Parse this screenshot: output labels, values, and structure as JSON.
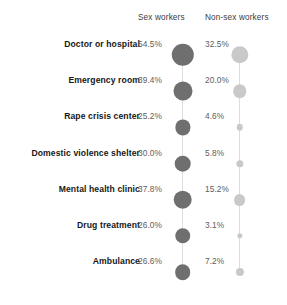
{
  "chart_data": {
    "type": "scatter",
    "title": "",
    "subtitle": "",
    "xlabel": "",
    "ylabel": "",
    "legend_position": "top",
    "grid": false,
    "encoding": "bubble area proportional to percentage",
    "categories": [
      "Doctor or hospital",
      "Emergency room",
      "Rape crisis center",
      "Domestic violence shelter",
      "Mental health clinic",
      "Drug treatment",
      "Ambulance"
    ],
    "series": [
      {
        "name": "Sex workers",
        "color": "#6f6f6f",
        "values": [
          54.5,
          39.4,
          25.2,
          30.0,
          37.8,
          26.0,
          26.6
        ],
        "labels": [
          "54.5%",
          "39.4%",
          "25.2%",
          "30.0%",
          "37.8%",
          "26.0%",
          "26.6%"
        ]
      },
      {
        "name": "Non-sex workers",
        "color": "#c9c9c9",
        "values": [
          32.5,
          20.0,
          4.6,
          5.8,
          15.2,
          3.1,
          7.2
        ],
        "labels": [
          "32.5%",
          "20.0%",
          "4.6%",
          "5.8%",
          "15.2%",
          "3.1%",
          "7.2%"
        ]
      }
    ]
  },
  "headers": {
    "sex_workers": "Sex workers",
    "non_sex_workers": "Non-sex workers"
  },
  "rows": [
    {
      "label": "Doctor or hospital",
      "sw": "54.5%",
      "nsw": "32.5%"
    },
    {
      "label": "Emergency room",
      "sw": "39.4%",
      "nsw": "20.0%"
    },
    {
      "label": "Rape crisis center",
      "sw": "25.2%",
      "nsw": "4.6%"
    },
    {
      "label": "Domestic violence shelter",
      "sw": "30.0%",
      "nsw": "5.8%"
    },
    {
      "label": "Mental health clinic",
      "sw": "37.8%",
      "nsw": "15.2%"
    },
    {
      "label": "Drug treatment",
      "sw": "26.0%",
      "nsw": "3.1%"
    },
    {
      "label": "Ambulance",
      "sw": "26.6%",
      "nsw": "7.2%"
    }
  ],
  "colors": {
    "sex_workers_bubble": "#6f6f6f",
    "non_sex_workers_bubble": "#c9c9c9",
    "spine": "#dedede",
    "label_text": "#171717",
    "value_text": "#5d5d5d",
    "background": "#ffffff"
  }
}
